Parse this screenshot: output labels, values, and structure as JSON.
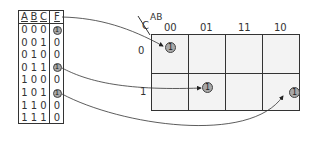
{
  "truth_table": {
    "headers": [
      "A",
      "B",
      "C",
      "F"
    ],
    "rows": [
      {
        "a": "0",
        "b": "0",
        "c": "0",
        "f": "1",
        "highlight": true
      },
      {
        "a": "0",
        "b": "0",
        "c": "1",
        "f": "0",
        "highlight": false
      },
      {
        "a": "0",
        "b": "1",
        "c": "0",
        "f": "0",
        "highlight": false
      },
      {
        "a": "0",
        "b": "1",
        "c": "1",
        "f": "1",
        "highlight": true
      },
      {
        "a": "1",
        "b": "0",
        "c": "0",
        "f": "0",
        "highlight": false
      },
      {
        "a": "1",
        "b": "0",
        "c": "1",
        "f": "1",
        "highlight": true
      },
      {
        "a": "1",
        "b": "1",
        "c": "0",
        "f": "0",
        "highlight": false
      },
      {
        "a": "1",
        "b": "1",
        "c": "1",
        "f": "0",
        "highlight": false
      }
    ]
  },
  "kmap": {
    "corner_row_var": "C",
    "corner_col_var": "AB",
    "col_labels": [
      "00",
      "01",
      "11",
      "10"
    ],
    "row_labels": [
      "0",
      "1"
    ],
    "cells": [
      [
        "1",
        "",
        "",
        ""
      ],
      [
        "",
        "1",
        "",
        "1"
      ]
    ],
    "cell_fill": "#f3f3f3",
    "circle_fill": "#a8a8a8"
  },
  "arrows": [
    {
      "from": "row 000",
      "to": "C=0, AB=00"
    },
    {
      "from": "row 011",
      "to": "C=1, AB=01"
    },
    {
      "from": "row 101",
      "to": "C=1, AB=10"
    }
  ]
}
